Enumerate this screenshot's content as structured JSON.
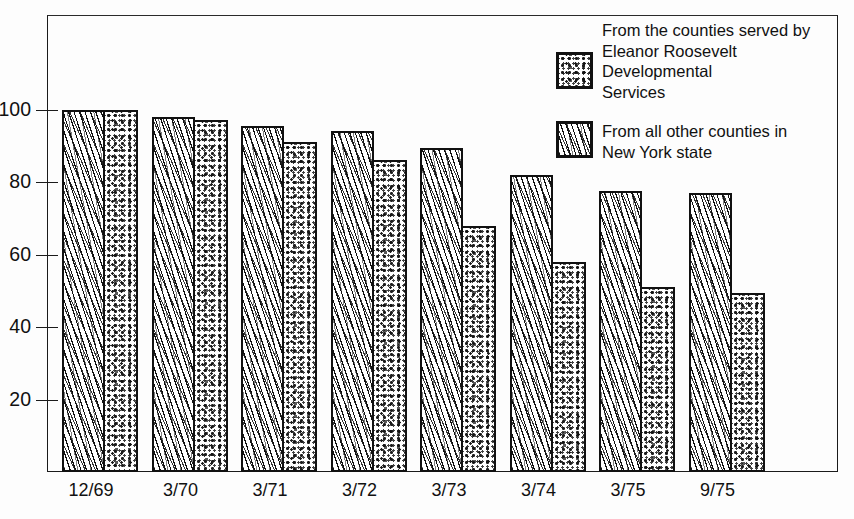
{
  "chart_data": {
    "type": "bar",
    "title": "",
    "subtitle": "",
    "xlabel": "",
    "ylabel": "",
    "categories": [
      "12/69",
      "3/70",
      "3/71",
      "3/72",
      "3/73",
      "3/74",
      "3/75",
      "9/75"
    ],
    "series": [
      {
        "name": "From all other counties in New York state",
        "pattern": "diagonal-wavy-lines",
        "values": [
          100,
          98,
          95.5,
          94,
          89.5,
          82,
          77.5,
          77
        ]
      },
      {
        "name": "From the counties served by Eleanor Roosevelt Developmental Services",
        "pattern": "mottled-stipple",
        "values": [
          100,
          97,
          91,
          86,
          68,
          58,
          51,
          49.5
        ]
      }
    ],
    "ylim": [
      0,
      115
    ],
    "yticks": [
      20,
      40,
      60,
      80,
      100
    ],
    "ytick_labels": [
      "20",
      "40",
      "60",
      "80",
      "100"
    ],
    "grid": false,
    "legend_position": "top-right",
    "frame": true
  },
  "legend": {
    "entries": [
      {
        "swatch": "stipple-swatch",
        "label": "From the counties served by\nEleanor Roosevelt\nDevelopmental\nServices"
      },
      {
        "swatch": "lines-swatch",
        "label": "From all other counties in\nNew York state"
      }
    ]
  },
  "axis": {
    "y_tick_labels": [
      "100",
      "80",
      "60",
      "40",
      "20"
    ],
    "x_tick_labels": [
      "12/69",
      "3/70",
      "3/71",
      "3/72",
      "3/73",
      "3/74",
      "3/75",
      "9/75"
    ]
  },
  "colors": {
    "ink": "#111111",
    "background": "#fdfdfd",
    "bar_fill": "#ffffff"
  }
}
